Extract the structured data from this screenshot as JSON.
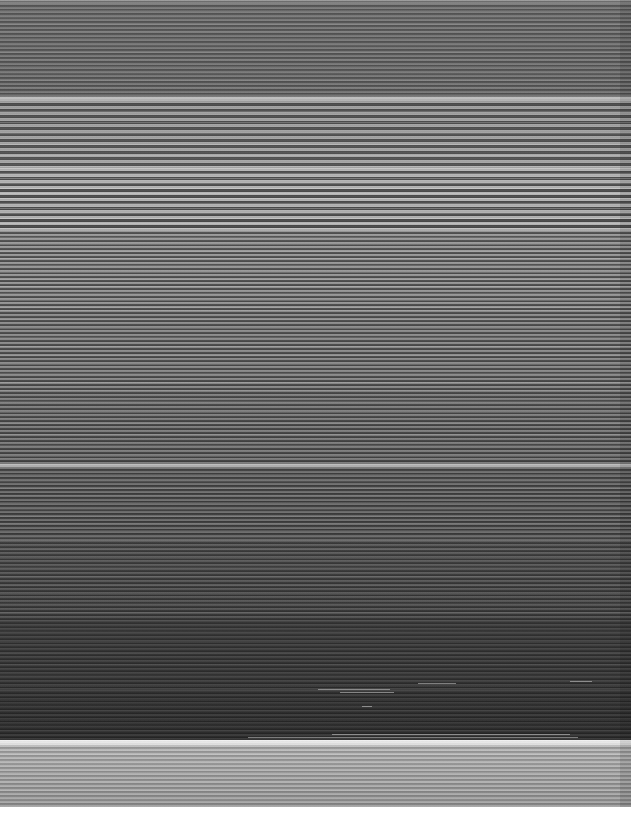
{
  "image": {
    "width": 631,
    "height": 819,
    "kind": "corrupted-screenshot",
    "artifact": "horizontal-line-smear",
    "description": "Screenshot destroyed by a horizontal scanline smear: each pixel row is stretched across the full width, so no text, icons or widgets are legible.",
    "colorspace": "grayscale",
    "legible_text": "none",
    "content_bottom": 807,
    "background": "#ffffff"
  },
  "regions": {
    "content_area": {
      "x": 0,
      "y": 0,
      "width": 631,
      "height": 807
    },
    "bottom_margin": {
      "y": 807,
      "height": 12,
      "color": "#ffffff"
    },
    "scrollbar_smear": {
      "x": 620,
      "width": 11,
      "color": "#000000",
      "opacity": 0.1
    }
  },
  "bands": [
    {
      "name": "top-edge-highlight",
      "y": 0,
      "height": 3,
      "top": "#8e8e8e",
      "bottom": "#6a6a6a",
      "lines": 1,
      "contrast": 0.1
    },
    {
      "name": "upper-gray-field",
      "y": 3,
      "height": 94,
      "top": "#636363",
      "bottom": "#5e5e5e",
      "lines": 2,
      "contrast": 0.16
    },
    {
      "name": "separator-upper",
      "y": 97,
      "height": 3,
      "top": "#c8c8c8",
      "bottom": "#b4b4b4",
      "lines": 1,
      "contrast": 0.05
    },
    {
      "name": "bright-banding-1",
      "y": 100,
      "height": 68,
      "top": "#6f6f6f",
      "bottom": "#7a7a7a",
      "lines": 3,
      "contrast": 0.34
    },
    {
      "name": "bright-banding-2",
      "y": 168,
      "height": 62,
      "top": "#808080",
      "bottom": "#767676",
      "lines": 3,
      "contrast": 0.42
    },
    {
      "name": "dense-scan-upper",
      "y": 230,
      "height": 80,
      "top": "#6e6e6e",
      "bottom": "#676767",
      "lines": 2,
      "contrast": 0.3
    },
    {
      "name": "dense-scan-mid",
      "y": 310,
      "height": 80,
      "top": "#646464",
      "bottom": "#5d5d5d",
      "lines": 2,
      "contrast": 0.27
    },
    {
      "name": "dense-scan-lower",
      "y": 390,
      "height": 74,
      "top": "#5a5a5a",
      "bottom": "#525252",
      "lines": 2,
      "contrast": 0.24
    },
    {
      "name": "separator-mid",
      "y": 464,
      "height": 3,
      "top": "#c0c0c0",
      "bottom": "#a8a8a8",
      "lines": 1,
      "contrast": 0.05
    },
    {
      "name": "darkening-field-1",
      "y": 467,
      "height": 73,
      "top": "#4e4e4e",
      "bottom": "#464646",
      "lines": 2,
      "contrast": 0.2
    },
    {
      "name": "darkening-field-2",
      "y": 540,
      "height": 80,
      "top": "#434343",
      "bottom": "#383838",
      "lines": 2,
      "contrast": 0.14
    },
    {
      "name": "dark-field",
      "y": 620,
      "height": 70,
      "top": "#343434",
      "bottom": "#2e2e2e",
      "lines": 2,
      "contrast": 0.09
    },
    {
      "name": "darkest-field",
      "y": 690,
      "height": 50,
      "top": "#2c2c2c",
      "bottom": "#272727",
      "lines": 2,
      "contrast": 0.07
    },
    {
      "name": "taskbar-highlight",
      "y": 740,
      "height": 5,
      "top": "#f2f2f2",
      "bottom": "#dcdcdc",
      "lines": 1,
      "contrast": 0.04
    },
    {
      "name": "taskbar-smear",
      "y": 745,
      "height": 62,
      "top": "#b2b2b2",
      "bottom": "#969696",
      "lines": 2,
      "contrast": 0.16
    }
  ],
  "bright_fragments": [
    {
      "x": 318,
      "y": 689,
      "width": 72
    },
    {
      "x": 340,
      "y": 692,
      "width": 54
    },
    {
      "x": 362,
      "y": 706,
      "width": 10
    },
    {
      "x": 418,
      "y": 683,
      "width": 38
    },
    {
      "x": 570,
      "y": 681,
      "width": 22
    },
    {
      "x": 332,
      "y": 734,
      "width": 238
    },
    {
      "x": 248,
      "y": 737,
      "width": 330
    }
  ]
}
